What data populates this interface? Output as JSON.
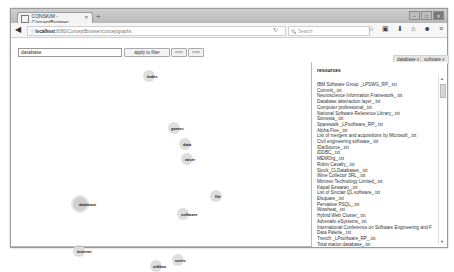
{
  "browser": {
    "tab_title": "CONSKIM - ConceptBrowser",
    "tab_close": "×",
    "new_tab": "+",
    "url_host": "localhost",
    "url_path": ":8080/ConceptBrowser/conceptgraphs",
    "search_placeholder": "Search",
    "window_controls": [
      "–",
      "□",
      "×"
    ],
    "nav_icons": [
      "☆",
      "▣",
      "⬇",
      "⌂",
      "☻",
      "≡"
    ]
  },
  "toolbar": {
    "filter_value": "database",
    "apply_label": "apply to filter",
    "btn2_label": "<<<",
    "btn3_label": ">>>"
  },
  "tags": [
    {
      "label": "database",
      "remove": "x"
    },
    {
      "label": "software",
      "remove": "x"
    }
  ],
  "graph": {
    "nodes": [
      {
        "label": "index",
        "x": 145,
        "y": 36
      },
      {
        "label": "games",
        "x": 170,
        "y": 90
      },
      {
        "label": "data",
        "x": 182,
        "y": 106
      },
      {
        "label": "wiser",
        "x": 184,
        "y": 121
      },
      {
        "label": "database",
        "x": 78,
        "y": 165
      },
      {
        "label": "file",
        "x": 213,
        "y": 158
      },
      {
        "label": "software",
        "x": 182,
        "y": 175
      },
      {
        "label": "internet",
        "x": 73,
        "y": 213
      },
      {
        "label": "users",
        "x": 174,
        "y": 222
      },
      {
        "label": "orkkau",
        "x": 151,
        "y": 226
      }
    ]
  },
  "resources": {
    "title": "resources",
    "items": [
      "IBM Software Group _LPSWG_RP_.txt",
      "Commit_.txt",
      "Neuroscience Information Framework_.txt",
      "Database abstraction layer_.txt",
      "Computer professional_.txt",
      "National Software Reference Library_.txt",
      "Sionesia_.txt",
      "Sparewalk _LPsoftware_RP_.txt",
      "Alpha Five_.txt",
      "List of mergers and acquisitions by Microsoft_.txt",
      "Civil engineering software_.txt",
      "IDatSource_.txt",
      "IDDBC_.txt",
      "MEMOrg_.txt",
      "Robin Cavalry_.txt",
      "Stock_CLDatabases_.txt",
      "Wine Collector 3RL_.txt",
      "Mimtrex Technology Limited_.txt",
      "Kapali Eswaran_.txt",
      "List of Sinclair QL software_.txt",
      "Elsquare_.txt",
      "Pervasive PSQL_.txt",
      "Wowheat_.txt",
      "Hybrid Web Cluster_.txt",
      "Adrenalin eSystems_.txt",
      "International Conference on Software Engineering and F",
      "Data Palette_.txt",
      "Trench _LPsoftware_RP_.txt",
      "Total station database_.txt"
    ]
  }
}
